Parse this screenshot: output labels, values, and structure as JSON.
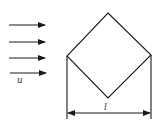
{
  "diagram": {
    "flow": {
      "label": "u",
      "arrow_count": 4,
      "arrows_y": [
        25,
        42,
        58,
        73
      ],
      "x_start": 9,
      "x_end": 45
    },
    "square": {
      "vertices": {
        "top": [
          108,
          13
        ],
        "left": [
          67,
          56
        ],
        "right": [
          151,
          55
        ],
        "bottom": [
          108,
          98
        ]
      },
      "orientation": "rotated 45 degrees (diamond)"
    },
    "dimension": {
      "label": "l",
      "y": 113,
      "x_left": 67,
      "x_right": 151
    },
    "colors": {
      "line": "#1a1a1a",
      "background": "#ffffff"
    }
  }
}
